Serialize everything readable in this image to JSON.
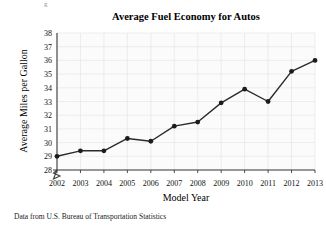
{
  "figure": {
    "title": "Average Fuel Economy for Autos",
    "source_note": "Data from U.S. Bureau of Transportation Statistics",
    "stray_mark": "g"
  },
  "chart_data": {
    "type": "line",
    "title": "Average Fuel Economy for Autos",
    "xlabel": "Model Year",
    "ylabel": "Average Miles per Gallon",
    "categories": [
      "2002",
      "2003",
      "2004",
      "2005",
      "2006",
      "2007",
      "2008",
      "2009",
      "2010",
      "2011",
      "2012",
      "2013"
    ],
    "values": [
      29.0,
      29.4,
      29.4,
      30.3,
      30.1,
      31.2,
      31.5,
      32.9,
      33.9,
      33.0,
      35.2,
      36.0
    ],
    "x": [
      2002,
      2003,
      2004,
      2005,
      2006,
      2007,
      2008,
      2009,
      2010,
      2011,
      2012,
      2013
    ],
    "ylim": [
      28,
      38
    ],
    "xlim": [
      2002,
      2013
    ],
    "yticks": [
      28,
      29,
      30,
      31,
      32,
      33,
      34,
      35,
      36,
      37,
      38
    ],
    "ytick_labels": [
      "28",
      "29",
      "30",
      "31",
      "32",
      "33",
      "34",
      "35",
      "36",
      "37",
      "38"
    ],
    "xtick_labels": [
      "2002",
      "2003",
      "2004",
      "2005",
      "2006",
      "2007",
      "2008",
      "2009",
      "2010",
      "2011",
      "2012",
      "2013"
    ],
    "grid": true,
    "legend": "none",
    "axis_break": "y-axis broken below 28",
    "marker": "filled-circle",
    "line_color": "#2b2b2b",
    "marker_color": "#1c1c1c",
    "grid_color": "#e2e2e6",
    "axis_color": "#3b3b3b",
    "plot_background": "#fbfbfb"
  }
}
